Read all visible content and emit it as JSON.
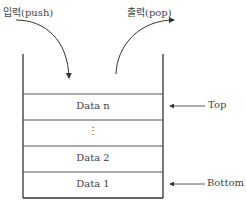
{
  "labels": {
    "push": "입력(push)",
    "pop": "출력(pop)",
    "top": "Top",
    "bottom": "Bottom"
  },
  "stack": {
    "cells": [
      {
        "label": "Data n"
      },
      {
        "label": "⋮"
      },
      {
        "label": "Data 2"
      },
      {
        "label": "Data 1"
      }
    ]
  }
}
